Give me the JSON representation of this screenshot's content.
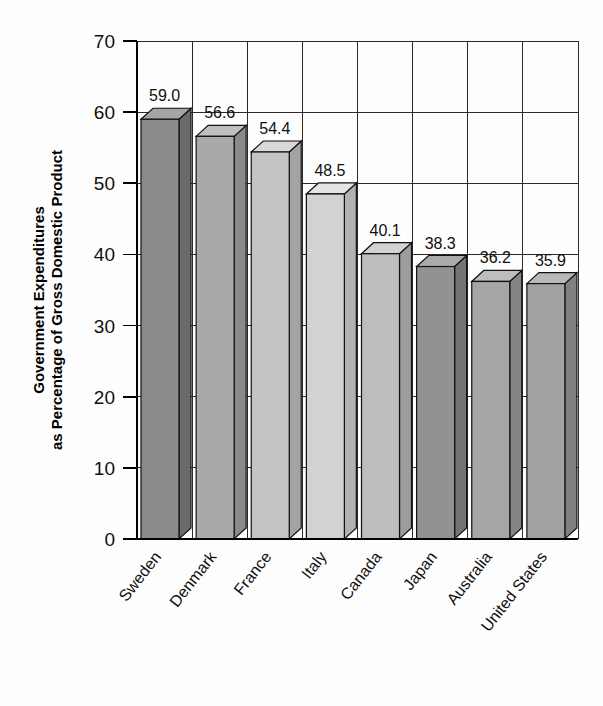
{
  "chart_data": {
    "type": "bar",
    "title": "",
    "subtitle": "",
    "xlabel": "",
    "ylabel": "Government Expenditures as Percentage of Gross Domestic Product",
    "ylabel_line1": "Government Expenditures",
    "ylabel_line2": "as Percentage of Gross Domestic Product",
    "categories": [
      "Sweden",
      "Denmark",
      "France",
      "Italy",
      "Canada",
      "Japan",
      "Australia",
      "United States"
    ],
    "values": [
      59.0,
      56.6,
      54.4,
      48.5,
      40.1,
      38.3,
      36.2,
      35.9
    ],
    "value_labels": [
      "59.0",
      "56.6",
      "54.4",
      "48.5",
      "40.1",
      "38.3",
      "36.2",
      "35.9"
    ],
    "ylim": [
      0,
      70
    ],
    "ytick_values": [
      0,
      10,
      20,
      30,
      40,
      50,
      60,
      70
    ],
    "ytick_labels": [
      "0",
      "10",
      "20",
      "30",
      "40",
      "50",
      "60",
      "70"
    ],
    "grid": "both",
    "legend": "none",
    "style": "3d-columns-grayscale",
    "bar_colors": [
      "#8b8b8b",
      "#a9a9a9",
      "#c4c4c4",
      "#d2d2d2",
      "#bdbdbd",
      "#929292",
      "#a6a6a6",
      "#a2a2a2"
    ],
    "bar_side_colors": [
      "#6b6b6b",
      "#8a8a8a",
      "#a3a3a3",
      "#b1b1b1",
      "#9c9c9c",
      "#747474",
      "#858585",
      "#818181"
    ],
    "bar_top_colors": [
      "#a5a5a5",
      "#c0c0c0",
      "#d8d8d8",
      "#e4e4e4",
      "#d2d2d2",
      "#aaaaaa",
      "#bdbdbd",
      "#b9b9b9"
    ],
    "axis_color": "#000000",
    "grid_color": "#2a2a2a",
    "background_color": "#fdfdfd"
  }
}
